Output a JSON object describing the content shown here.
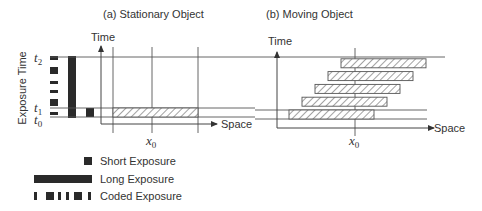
{
  "panels": [
    {
      "id": "a",
      "title": "(a) Stationary Object",
      "time_axis_label": "Time",
      "space_axis_label": "Space",
      "x_marker": "x",
      "x_marker_sub": "0"
    },
    {
      "id": "b",
      "title": "(b) Moving Object",
      "time_axis_label": "Time",
      "space_axis_label": "Space",
      "x_marker": "x",
      "x_marker_sub": "0"
    }
  ],
  "y_axis_label": "Exposure Time",
  "time_marks": [
    {
      "name": "t",
      "sub": "2"
    },
    {
      "name": "t",
      "sub": "1"
    },
    {
      "name": "t",
      "sub": "0"
    }
  ],
  "legend": [
    {
      "key": "short",
      "label": "Short Exposure"
    },
    {
      "key": "long",
      "label": "Long Exposure"
    },
    {
      "key": "coded",
      "label": "Coded Exposure"
    }
  ],
  "moving_bars_count": 5
}
